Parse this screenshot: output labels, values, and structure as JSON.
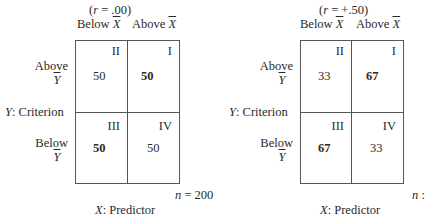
{
  "panels": [
    {
      "r_label": "(r = .00)",
      "r_var": "r",
      "r_value": ".00",
      "col_headers": [
        "Below",
        "Above"
      ],
      "col_var": "X",
      "row_headers": [
        "Above",
        "Below"
      ],
      "row_var": "Y",
      "y_axis_label": "Criterion",
      "x_axis_label": "Predictor",
      "n_label": "n = 200",
      "n_var": "n",
      "n_value": "= 200",
      "cells": {
        "II": {
          "quadrant": "II",
          "value": "50",
          "bold": false
        },
        "I": {
          "quadrant": "I",
          "value": "50",
          "bold": true
        },
        "III": {
          "quadrant": "III",
          "value": "50",
          "bold": true
        },
        "IV": {
          "quadrant": "IV",
          "value": "50",
          "bold": false
        }
      }
    },
    {
      "r_label": "(r = +.50)",
      "r_var": "r",
      "r_value": "+.50",
      "col_headers": [
        "Below",
        "Above"
      ],
      "col_var": "X",
      "row_headers": [
        "Above",
        "Below"
      ],
      "row_var": "Y",
      "y_axis_label": "Criterion",
      "x_axis_label": "Predictor",
      "n_label": "n :",
      "n_var": "n",
      "n_value": ":",
      "cells": {
        "II": {
          "quadrant": "II",
          "value": "33",
          "bold": false
        },
        "I": {
          "quadrant": "I",
          "value": "67",
          "bold": true
        },
        "III": {
          "quadrant": "III",
          "value": "67",
          "bold": true
        },
        "IV": {
          "quadrant": "IV",
          "value": "33",
          "bold": false
        }
      }
    }
  ],
  "labels": {
    "eq": "=",
    "open": "(",
    "close": ")",
    "colon": ":"
  }
}
